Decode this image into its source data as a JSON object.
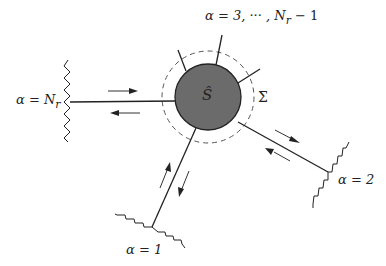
{
  "diagram": {
    "type": "scattering-network",
    "central_node": {
      "label": "Ŝ",
      "fill": "#6b6b6b",
      "stroke": "#222222"
    },
    "boundary": {
      "label": "Σ",
      "style": "dashed"
    },
    "channels": [
      {
        "id": "alpha-Nr",
        "label": "α = N",
        "subscript": "r",
        "position": "left",
        "lead_style": "zigzag-vertical",
        "arrows": [
          "in",
          "out"
        ]
      },
      {
        "id": "alpha-3-to-Nr-1",
        "label": "α = 3, ··· , N",
        "subscript": "r",
        "suffix": " − 1",
        "position": "top",
        "lead_style": "open-lines"
      },
      {
        "id": "alpha-2",
        "label": "α = 2",
        "position": "lower-right",
        "lead_style": "zigzag",
        "arrows": [
          "out",
          "in"
        ]
      },
      {
        "id": "alpha-1",
        "label": "α = 1",
        "position": "bottom-left",
        "lead_style": "zigzag",
        "arrows": [
          "in",
          "out"
        ]
      }
    ]
  }
}
